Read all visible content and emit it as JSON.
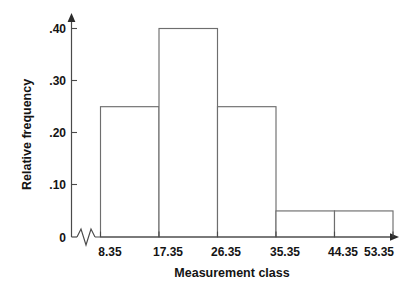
{
  "chart_data": {
    "type": "bar",
    "title": "",
    "subtitle": "",
    "xlabel": "Measurement class",
    "ylabel": "Relative frequency",
    "categories": [
      "8.35-17.35",
      "17.35-26.35",
      "26.35-35.35",
      "35.35-44.35",
      "44.35-53.35"
    ],
    "values": [
      0.25,
      0.4,
      0.25,
      0.05,
      0.05
    ],
    "bin_edges": [
      8.35,
      17.35,
      26.35,
      35.35,
      44.35,
      53.35
    ],
    "x_tick_labels": [
      "8.35",
      "17.35",
      "26.35",
      "35.35",
      "44.35",
      "53.35"
    ],
    "y_tick_labels": [
      "0",
      ".10",
      ".20",
      ".30",
      ".40"
    ],
    "y_tick_values": [
      0,
      0.1,
      0.2,
      0.3,
      0.4
    ],
    "ylim": [
      0,
      0.4
    ],
    "xlim": [
      8.35,
      53.35
    ],
    "grid": false,
    "legend": null,
    "legend_position": "none",
    "annotations": [
      {
        "name": "x-axis-break",
        "label": "axis break zigzag between origin and first tick"
      }
    ],
    "style": {
      "bar_fill": "#ffffff",
      "bar_stroke": "#6e6e6e",
      "axis_color": "#4a4a4a",
      "text_color": "#141414",
      "background": "#ffffff"
    }
  },
  "axes": {
    "y": {
      "title": "Relative frequency",
      "ticks": [
        {
          "label": ".40",
          "value": 0.4
        },
        {
          "label": ".30",
          "value": 0.3
        },
        {
          "label": ".20",
          "value": 0.2
        },
        {
          "label": ".10",
          "value": 0.1
        },
        {
          "label": "0",
          "value": 0
        }
      ]
    },
    "x": {
      "title": "Measurement class",
      "ticks": [
        {
          "label": "8.35",
          "value": 8.35
        },
        {
          "label": "17.35",
          "value": 17.35
        },
        {
          "label": "26.35",
          "value": 26.35
        },
        {
          "label": "35.35",
          "value": 35.35
        },
        {
          "label": "44.35",
          "value": 44.35
        },
        {
          "label": "53.35",
          "value": 53.35
        }
      ]
    }
  },
  "bars": [
    {
      "label": "8.35-17.35",
      "value": 0.25
    },
    {
      "label": "17.35-26.35",
      "value": 0.4
    },
    {
      "label": "26.35-35.35",
      "value": 0.25
    },
    {
      "label": "35.35-44.35",
      "value": 0.05
    },
    {
      "label": "44.35-53.35",
      "value": 0.05
    }
  ]
}
